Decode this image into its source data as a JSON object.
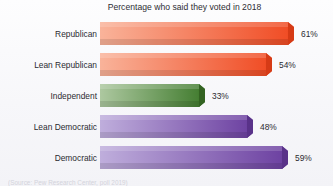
{
  "chart_data": {
    "type": "bar",
    "orientation": "horizontal",
    "title": "Percentage who said they voted in 2018",
    "xlabel": "",
    "ylabel": "",
    "xlim": [
      0,
      75
    ],
    "grid": false,
    "legend": null,
    "source": "(Source: Pew Research Center, poll 2019)",
    "categories": [
      "Republican",
      "Lean Republican",
      "Independent",
      "Lean Democratic",
      "Democratic"
    ],
    "values": [
      61,
      54,
      33,
      48,
      59
    ],
    "value_labels": [
      "61%",
      "54%",
      "33%",
      "48%",
      "59%"
    ],
    "bar_colors": [
      "#F0502A",
      "#F0502A",
      "#4F8A3D",
      "#7B51AD",
      "#7B51AD"
    ],
    "bar_colors_light": [
      "#F8A98E",
      "#F8A98E",
      "#A8C59B",
      "#B8A4D6",
      "#B8A4D6"
    ],
    "bars": [
      {
        "category": "Republican",
        "value": 61,
        "label": "61%",
        "color_start": "#F9B39A",
        "color_end": "#F04A22",
        "cap_color": "#D63B16"
      },
      {
        "category": "Lean Republican",
        "value": 54,
        "label": "54%",
        "color_start": "#F9B39A",
        "color_end": "#F04A22",
        "cap_color": "#D63B16"
      },
      {
        "category": "Independent",
        "value": 33,
        "label": "33%",
        "color_start": "#ADC8A0",
        "color_end": "#3F7A2C",
        "cap_color": "#336322"
      },
      {
        "category": "Lean Democratic",
        "value": 48,
        "label": "48%",
        "color_start": "#BFAEDC",
        "color_end": "#6B3FA0",
        "cap_color": "#593289"
      },
      {
        "category": "Democratic",
        "value": 59,
        "label": "59%",
        "color_start": "#BFAEDC",
        "color_end": "#6B3FA0",
        "cap_color": "#593289"
      }
    ]
  }
}
